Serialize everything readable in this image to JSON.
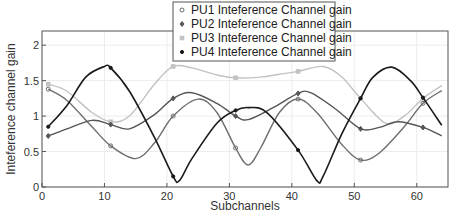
{
  "chart_data": {
    "type": "line",
    "title": "",
    "xlabel": "Subchannels",
    "ylabel": "Inteference channel gain",
    "xlim": [
      0,
      65
    ],
    "ylim": [
      0,
      2.2
    ],
    "xticks": [
      0,
      10,
      20,
      30,
      40,
      50,
      60
    ],
    "yticks": [
      0,
      0.5,
      1,
      1.5,
      2
    ],
    "xtick_labels": [
      "0",
      "10",
      "20",
      "30",
      "40",
      "50",
      "60"
    ],
    "ytick_labels": [
      "0",
      "0.5",
      "1",
      "1.5",
      "2"
    ],
    "grid": true,
    "legend_position": "top-center",
    "series": [
      {
        "name": "PU1 Inteference Channel gain",
        "color": "#6e6e6e",
        "marker": "circle",
        "marker_x": [
          1,
          11,
          21,
          31,
          41,
          51,
          61
        ],
        "x": [
          1,
          4,
          8,
          11,
          15,
          18,
          21,
          25,
          28,
          31,
          33,
          35,
          38,
          41,
          44,
          48,
          51,
          54,
          58,
          61,
          64
        ],
        "y": [
          1.38,
          1.22,
          0.85,
          0.58,
          0.4,
          0.62,
          1.0,
          1.24,
          1.05,
          0.55,
          0.31,
          0.55,
          1.05,
          1.24,
          1.05,
          0.6,
          0.38,
          0.48,
          0.85,
          1.18,
          1.36
        ]
      },
      {
        "name": "PU2 Inteference Channel gain",
        "color": "#555555",
        "marker": "diamond",
        "marker_x": [
          1,
          11,
          21,
          31,
          41,
          51,
          61
        ],
        "x": [
          1,
          4,
          8,
          11,
          14,
          18,
          21,
          24,
          28,
          31,
          33,
          37,
          41,
          43,
          47,
          51,
          54,
          57,
          61,
          64
        ],
        "y": [
          0.72,
          0.82,
          0.94,
          0.88,
          0.82,
          1.02,
          1.25,
          1.33,
          1.18,
          1.0,
          0.95,
          1.12,
          1.32,
          1.33,
          1.1,
          0.82,
          0.84,
          0.92,
          0.84,
          0.72
        ]
      },
      {
        "name": "PU3 Inteference Channel gain",
        "color": "#c2c2c2",
        "marker": "square",
        "marker_x": [
          1,
          11,
          21,
          31,
          41,
          51,
          61
        ],
        "x": [
          1,
          4,
          8,
          11,
          14,
          18,
          21,
          24,
          28,
          31,
          35,
          38,
          41,
          45,
          48,
          51,
          55,
          58,
          61,
          64
        ],
        "y": [
          1.45,
          1.35,
          1.05,
          0.92,
          1.0,
          1.45,
          1.7,
          1.68,
          1.58,
          1.54,
          1.55,
          1.59,
          1.63,
          1.7,
          1.55,
          1.25,
          0.9,
          1.0,
          1.25,
          1.43
        ]
      },
      {
        "name": "PU4 Inteference Channel gain",
        "color": "#1a1a1a",
        "marker": "dot",
        "marker_x": [
          1,
          11,
          21,
          31,
          41,
          51,
          61
        ],
        "x": [
          1,
          4,
          7,
          10,
          11,
          14,
          18,
          21,
          22,
          24,
          28,
          31,
          33,
          36,
          41,
          44,
          45,
          48,
          51,
          53,
          56,
          59,
          61,
          64
        ],
        "y": [
          0.85,
          1.15,
          1.55,
          1.7,
          1.68,
          1.35,
          0.7,
          0.15,
          0.09,
          0.4,
          0.9,
          1.08,
          1.12,
          1.05,
          0.52,
          0.09,
          0.15,
          0.75,
          1.25,
          1.55,
          1.69,
          1.5,
          1.26,
          0.87
        ]
      }
    ]
  }
}
